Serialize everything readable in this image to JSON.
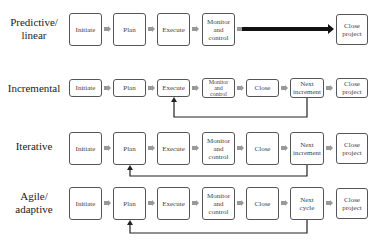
{
  "rows": [
    {
      "label": "Predictive/ linear",
      "label_lines": [
        "Predictive/",
        "linear"
      ],
      "steps": [
        "Initiate",
        "Plan",
        "Execute",
        "Monitor and control",
        "Close project"
      ],
      "connector": "thick-arrow"
    },
    {
      "label": "Incremental",
      "label_lines": [
        "Incremental"
      ],
      "steps": [
        "Initiate",
        "Plan",
        "Execute",
        "Monitor and control",
        "Close",
        "Next increment",
        "Close project"
      ],
      "feedback": {
        "from": "Next increment",
        "to": "Execute"
      }
    },
    {
      "label": "Iterative",
      "label_lines": [
        "Iterative"
      ],
      "steps": [
        "Initiate",
        "Plan",
        "Execute",
        "Monitor and control",
        "Close",
        "Next increment",
        "Close project"
      ],
      "feedback": {
        "from": "Next increment",
        "to": "Plan"
      }
    },
    {
      "label": "Agile/ adaptive",
      "label_lines": [
        "Agile/",
        "adaptive"
      ],
      "steps": [
        "Initiate",
        "Plan",
        "Execute",
        "Monitor and control",
        "Close",
        "Next cycle",
        "Close project"
      ],
      "feedback": {
        "from": "Next cycle",
        "to": "Plan"
      }
    }
  ],
  "box_text": {
    "initiate": "Initiate",
    "plan": "Plan",
    "execute": "Execute",
    "monitor_1": "Monitor",
    "monitor_2": "and",
    "monitor_3": "control",
    "close": "Close",
    "close_project_1": "Close",
    "close_project_2": "project",
    "next_1": "Next",
    "next_increment_2": "increment",
    "next_cycle_2": "cycle"
  }
}
